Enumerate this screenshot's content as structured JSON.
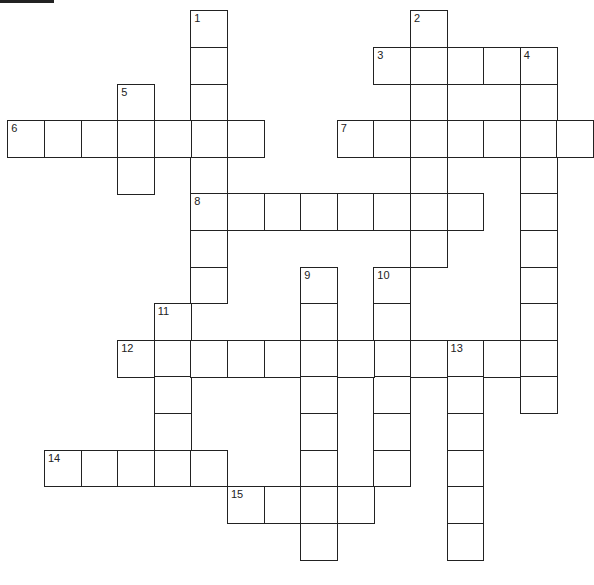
{
  "puzzle": {
    "title_fragment": "",
    "cell_size": 36.6,
    "origin_x": 8,
    "origin_y": 11,
    "line_color": "#222222",
    "words": [
      {
        "number": 1,
        "direction": "down",
        "col": 5,
        "row": 0,
        "length": 8
      },
      {
        "number": 2,
        "direction": "down",
        "col": 11,
        "row": 0,
        "length": 7
      },
      {
        "number": 3,
        "direction": "across",
        "col": 10,
        "row": 1,
        "length": 5
      },
      {
        "number": 4,
        "direction": "down",
        "col": 14,
        "row": 1,
        "length": 10
      },
      {
        "number": 5,
        "direction": "down",
        "col": 3,
        "row": 2,
        "length": 3
      },
      {
        "number": 6,
        "direction": "across",
        "col": 0,
        "row": 3,
        "length": 7
      },
      {
        "number": 7,
        "direction": "across",
        "col": 9,
        "row": 3,
        "length": 7
      },
      {
        "number": 8,
        "direction": "across",
        "col": 5,
        "row": 5,
        "length": 8
      },
      {
        "number": 9,
        "direction": "down",
        "col": 8,
        "row": 7,
        "length": 8
      },
      {
        "number": 10,
        "direction": "down",
        "col": 10,
        "row": 7,
        "length": 6
      },
      {
        "number": 11,
        "direction": "down",
        "col": 4,
        "row": 8,
        "length": 5
      },
      {
        "number": 12,
        "direction": "across",
        "col": 3,
        "row": 9,
        "length": 12
      },
      {
        "number": 13,
        "direction": "down",
        "col": 12,
        "row": 9,
        "length": 6
      },
      {
        "number": 14,
        "direction": "across",
        "col": 1,
        "row": 12,
        "length": 5
      },
      {
        "number": 15,
        "direction": "across",
        "col": 6,
        "row": 13,
        "length": 4
      }
    ]
  }
}
